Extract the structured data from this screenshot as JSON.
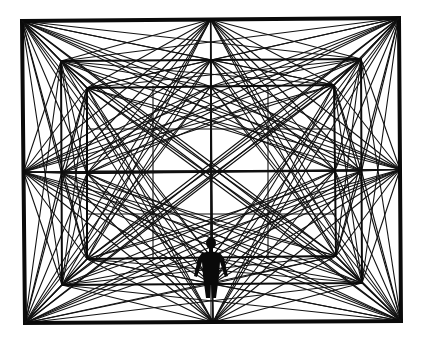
{
  "illustration": {
    "subject": "perspective room of radiating lines with standing human figure",
    "colors": {
      "background": "#ffffff",
      "ink": "#0a0a0a"
    },
    "frames": [
      {
        "name": "outer",
        "tl": [
          22,
          21
        ],
        "tr": [
          399,
          18
        ],
        "br": [
          401,
          321
        ],
        "bl": [
          25,
          323
        ],
        "stroke": 4
      },
      {
        "name": "middle",
        "tl": [
          61,
          61
        ],
        "tr": [
          361,
          59
        ],
        "br": [
          362,
          283
        ],
        "bl": [
          62,
          285
        ],
        "stroke": 2
      },
      {
        "name": "inner",
        "tl": [
          87,
          88
        ],
        "tr": [
          334,
          85
        ],
        "br": [
          336,
          256
        ],
        "bl": [
          87,
          259
        ],
        "stroke": 2
      }
    ],
    "grid": {
      "verticals": [
        153,
        211,
        268
      ],
      "horizontals": [
        129,
        171,
        214
      ]
    },
    "figure": {
      "head_center": [
        211,
        243
      ],
      "feet": [
        211,
        298
      ]
    }
  }
}
